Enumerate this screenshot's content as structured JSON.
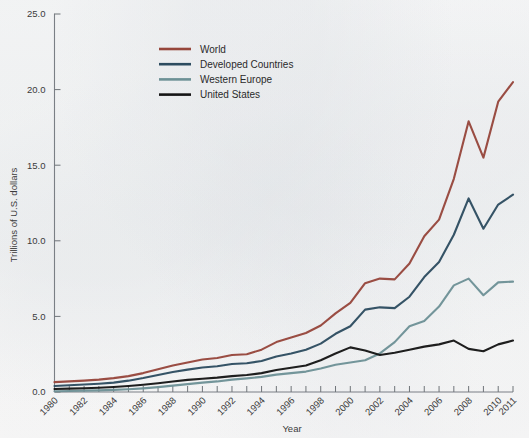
{
  "chart_data": {
    "type": "line",
    "title": "",
    "xlabel": "Year",
    "ylabel": "Trillions of U.S. dollars",
    "xlim": [
      1980,
      2011
    ],
    "ylim": [
      0.0,
      25.0
    ],
    "yticks": [
      "0.0",
      "5.0",
      "10.0",
      "15.0",
      "20.0",
      "25.0"
    ],
    "grid": false,
    "legend_position": "top-center",
    "x": [
      1980,
      1981,
      1982,
      1983,
      1984,
      1985,
      1986,
      1987,
      1988,
      1989,
      1990,
      1991,
      1992,
      1993,
      1994,
      1995,
      1996,
      1997,
      1998,
      1999,
      2000,
      2001,
      2002,
      2003,
      2004,
      2005,
      2006,
      2007,
      2008,
      2009,
      2010,
      2011
    ],
    "xtick_labels": [
      "1980",
      "1982",
      "1984",
      "1986",
      "1988",
      "1990",
      "1992",
      "1994",
      "1996",
      "1998",
      "2000",
      "2002",
      "2004",
      "2006",
      "2008",
      "2010",
      "2011"
    ],
    "series": [
      {
        "name": "World",
        "color": "#96463b",
        "values": [
          0.65,
          0.7,
          0.75,
          0.82,
          0.92,
          1.05,
          1.25,
          1.5,
          1.75,
          1.95,
          2.15,
          2.25,
          2.45,
          2.5,
          2.8,
          3.3,
          3.6,
          3.9,
          4.4,
          5.2,
          5.9,
          7.2,
          7.5,
          7.45,
          8.5,
          10.3,
          11.4,
          14.1,
          17.9,
          15.5,
          19.2,
          20.5
        ]
      },
      {
        "name": "Developed Countries",
        "color": "#2d4c60",
        "values": [
          0.4,
          0.45,
          0.5,
          0.55,
          0.62,
          0.75,
          0.92,
          1.12,
          1.32,
          1.48,
          1.62,
          1.7,
          1.85,
          1.9,
          2.05,
          2.35,
          2.55,
          2.8,
          3.2,
          3.85,
          4.35,
          5.45,
          5.6,
          5.55,
          6.3,
          7.6,
          8.6,
          10.4,
          12.8,
          10.8,
          12.4,
          13.05
        ]
      },
      {
        "name": "Western Europe",
        "color": "#6d9196",
        "values": [
          0.05,
          0.07,
          0.09,
          0.11,
          0.14,
          0.18,
          0.24,
          0.32,
          0.42,
          0.52,
          0.62,
          0.7,
          0.82,
          0.9,
          1.0,
          1.15,
          1.25,
          1.35,
          1.55,
          1.8,
          1.95,
          2.1,
          2.55,
          3.3,
          4.35,
          4.7,
          5.65,
          7.05,
          7.5,
          6.4,
          7.25,
          7.3
        ]
      },
      {
        "name": "United States",
        "color": "#151515",
        "values": [
          0.2,
          0.22,
          0.25,
          0.28,
          0.33,
          0.4,
          0.48,
          0.58,
          0.7,
          0.8,
          0.88,
          0.95,
          1.05,
          1.12,
          1.25,
          1.45,
          1.6,
          1.75,
          2.1,
          2.55,
          2.95,
          2.75,
          2.45,
          2.6,
          2.8,
          3.0,
          3.15,
          3.4,
          2.85,
          2.7,
          3.15,
          3.4
        ]
      }
    ]
  },
  "axis": {
    "y_title": "Trillions of U.S. dollars",
    "x_title": "Year"
  },
  "legend": {
    "items": [
      {
        "label": "World",
        "color": "#96463b"
      },
      {
        "label": "Developed Countries",
        "color": "#2d4c60"
      },
      {
        "label": "Western Europe",
        "color": "#6d9196"
      },
      {
        "label": "United States",
        "color": "#151515"
      }
    ]
  }
}
